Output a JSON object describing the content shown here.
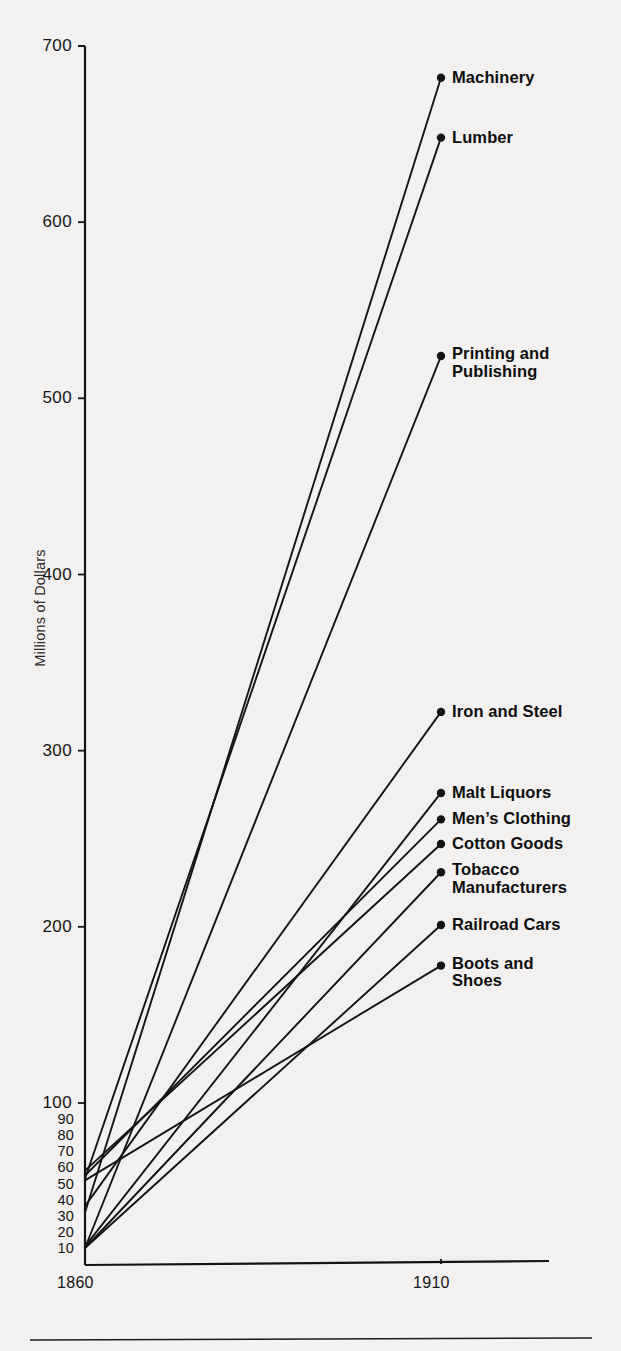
{
  "figure": {
    "background_color": "#f2f1ef",
    "ink_color": "#141414"
  },
  "axes": {
    "y_title": "Millions of Dollars",
    "y_major_ticks": [
      "700",
      "600",
      "500",
      "400",
      "300",
      "200",
      "100"
    ],
    "y_minor_ticks": [
      "90",
      "80",
      "70",
      "60",
      "50",
      "40",
      "30",
      "20",
      "10"
    ],
    "x_ticks": [
      "1860",
      "1910"
    ]
  },
  "chart_data": {
    "type": "line",
    "title": "",
    "xlabel": "",
    "ylabel": "Millions of Dollars",
    "x": [
      1860,
      1910
    ],
    "xlim": [
      1860,
      1910
    ],
    "ylim": [
      0,
      700
    ],
    "grid": false,
    "legend": "right-endpoint-labels",
    "y_major_ticks": [
      100,
      200,
      300,
      400,
      500,
      600,
      700
    ],
    "y_minor_ticks": [
      10,
      20,
      30,
      40,
      50,
      60,
      70,
      80,
      90
    ],
    "note": "Lower decade (0-100) drawn on an expanded sub-scale; values at 1910 read off endpoint dots.",
    "series": [
      {
        "name": "Machinery",
        "values": [
          32,
          682
        ]
      },
      {
        "name": "Lumber",
        "values": [
          53,
          648
        ]
      },
      {
        "name": "Printing and Publishing",
        "values": [
          10,
          524
        ]
      },
      {
        "name": "Iron and Steel",
        "values": [
          36,
          322
        ]
      },
      {
        "name": "Malt Liquors",
        "values": [
          11,
          276
        ]
      },
      {
        "name": "Men's Clothing",
        "values": [
          55,
          261
        ]
      },
      {
        "name": "Cotton Goods",
        "values": [
          58,
          247
        ]
      },
      {
        "name": "Tobacco Manufacturers",
        "values": [
          10,
          231
        ]
      },
      {
        "name": "Railroad Cars",
        "values": [
          10,
          201
        ]
      },
      {
        "name": "Boots and Shoes",
        "values": [
          52,
          178
        ]
      }
    ]
  },
  "series_labels": [
    {
      "name": "Machinery",
      "text": "Machinery"
    },
    {
      "name": "Lumber",
      "text": "Lumber"
    },
    {
      "name": "Printing and Publishing",
      "text": "Printing and\nPublishing"
    },
    {
      "name": "Iron and Steel",
      "text": "Iron and Steel"
    },
    {
      "name": "Malt Liquors",
      "text": "Malt Liquors"
    },
    {
      "name": "Men's Clothing",
      "text": "Men’s Clothing"
    },
    {
      "name": "Cotton Goods",
      "text": "Cotton Goods"
    },
    {
      "name": "Tobacco Manufacturers",
      "text": "Tobacco\nManufacturers"
    },
    {
      "name": "Railroad Cars",
      "text": "Railroad Cars"
    },
    {
      "name": "Boots and Shoes",
      "text": "Boots and\nShoes"
    }
  ]
}
